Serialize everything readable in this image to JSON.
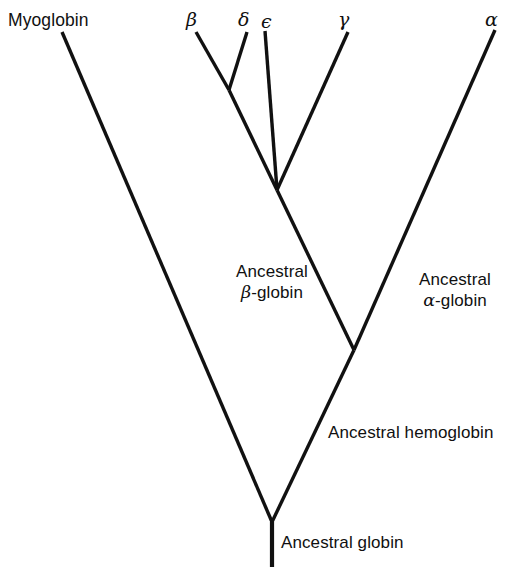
{
  "figure": {
    "background_color": "#ffffff",
    "line_color": "#111111",
    "text_color": "#101010",
    "width": 520,
    "height": 573
  },
  "tips": [
    {
      "id": "myoglobin",
      "label": "Myoglobin",
      "script": "latin",
      "x": 8,
      "y": 10
    },
    {
      "id": "beta",
      "label": "β",
      "script": "greek",
      "x": 186,
      "y": 8
    },
    {
      "id": "delta",
      "label": "δ",
      "script": "greek",
      "x": 238,
      "y": 8
    },
    {
      "id": "epsilon",
      "label": "ϵ",
      "script": "greek",
      "x": 261,
      "y": 10
    },
    {
      "id": "gamma",
      "label": "γ",
      "script": "greek",
      "x": 338,
      "y": 8
    },
    {
      "id": "alpha",
      "label": "α",
      "script": "greek",
      "x": 485,
      "y": 8
    }
  ],
  "node_labels": [
    {
      "id": "ancestral-beta-globin",
      "lines": [
        "Ancestral",
        "β-globin"
      ],
      "greek_line_index": 1,
      "greek_char": "β",
      "greek_rest": "-globin",
      "align": "center",
      "x": 210,
      "y": 262,
      "width": 124
    },
    {
      "id": "ancestral-alpha-globin",
      "lines": [
        "Ancestral",
        "α-globin"
      ],
      "greek_line_index": 1,
      "greek_char": "α",
      "greek_rest": "-globin",
      "align": "center",
      "x": 399,
      "y": 270,
      "width": 112
    },
    {
      "id": "ancestral-hemoglobin",
      "lines": [
        "Ancestral hemoglobin"
      ],
      "greek_line_index": -1,
      "greek_char": "",
      "greek_rest": "",
      "align": "left",
      "x": 328,
      "y": 423,
      "width": 190
    },
    {
      "id": "ancestral-globin",
      "lines": [
        "Ancestral globin"
      ],
      "greek_line_index": -1,
      "greek_char": "",
      "greek_rest": "",
      "align": "left",
      "x": 281,
      "y": 533,
      "width": 160
    }
  ],
  "nodes": {
    "root": {
      "x": 272,
      "y": 522
    },
    "root_base": {
      "x": 272,
      "y": 567
    },
    "hemoglobin": {
      "x": 354,
      "y": 350
    },
    "beta_cluster": {
      "x": 277,
      "y": 190
    },
    "beta_delta": {
      "x": 229,
      "y": 90
    },
    "tip_myoglobin": {
      "x": 62,
      "y": 32
    },
    "tip_beta": {
      "x": 196,
      "y": 32
    },
    "tip_delta": {
      "x": 247,
      "y": 32
    },
    "tip_epsilon": {
      "x": 265,
      "y": 31
    },
    "tip_gamma": {
      "x": 348,
      "y": 32
    },
    "tip_alpha": {
      "x": 495,
      "y": 30
    }
  },
  "branches": [
    {
      "id": "branch-myoglobin",
      "from": "tip_myoglobin",
      "to": "root",
      "style": "normal"
    },
    {
      "id": "branch-root-to-hemo",
      "from": "root",
      "to": "hemoglobin",
      "style": "normal"
    },
    {
      "id": "branch-alpha",
      "from": "hemoglobin",
      "to": "tip_alpha",
      "style": "normal"
    },
    {
      "id": "branch-hemo-to-beta",
      "from": "hemoglobin",
      "to": "beta_cluster",
      "style": "normal"
    },
    {
      "id": "branch-gamma",
      "from": "beta_cluster",
      "to": "tip_gamma",
      "style": "normal"
    },
    {
      "id": "branch-beta-epsilon",
      "from": "beta_cluster",
      "to": "tip_epsilon",
      "style": "normal"
    },
    {
      "id": "branch-beta-delta-stem",
      "from": "beta_cluster",
      "to": "beta_delta",
      "style": "normal"
    },
    {
      "id": "branch-beta",
      "from": "beta_delta",
      "to": "tip_beta",
      "style": "normal"
    },
    {
      "id": "branch-delta",
      "from": "beta_delta",
      "to": "tip_delta",
      "style": "normal"
    },
    {
      "id": "branch-root-stem",
      "from": "root",
      "to": "root_base",
      "style": "stem"
    }
  ]
}
